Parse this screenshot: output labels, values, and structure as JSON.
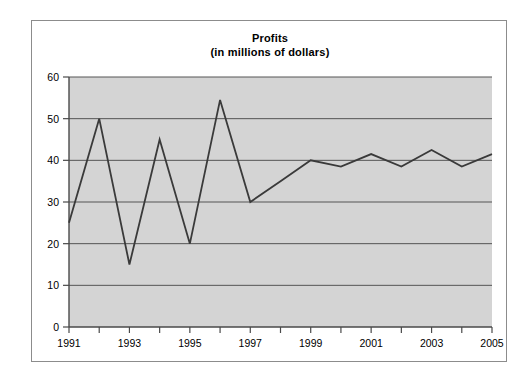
{
  "chart_data": {
    "type": "line",
    "title": "Profits",
    "subtitle": "(in millions of dollars)",
    "xlabel": "",
    "ylabel": "",
    "x": [
      1991,
      1992,
      1993,
      1994,
      1995,
      1996,
      1997,
      1998,
      1999,
      2000,
      2001,
      2002,
      2003,
      2004,
      2005
    ],
    "values": [
      25,
      50,
      15,
      45,
      20,
      54.5,
      30,
      35,
      40,
      38.5,
      41.5,
      38.5,
      42.5,
      38.5,
      41.5
    ],
    "series": [
      {
        "name": "Profits",
        "values": [
          25,
          50,
          15,
          45,
          20,
          54.5,
          30,
          35,
          40,
          38.5,
          41.5,
          38.5,
          42.5,
          38.5,
          41.5
        ]
      }
    ],
    "xlim": [
      1991,
      2005
    ],
    "ylim": [
      0,
      60
    ],
    "y_ticks": [
      0,
      10,
      20,
      30,
      40,
      50,
      60
    ],
    "y_tick_labels": [
      "0",
      "10",
      "20",
      "30",
      "40",
      "50",
      "60"
    ],
    "x_ticks": [
      1991,
      1992,
      1993,
      1994,
      1995,
      1996,
      1997,
      1998,
      1999,
      2000,
      2001,
      2002,
      2003,
      2004,
      2005
    ],
    "x_tick_labels": [
      "1991",
      "",
      "1993",
      "",
      "1995",
      "",
      "1997",
      "",
      "1999",
      "",
      "2001",
      "",
      "2003",
      "",
      "2005"
    ],
    "x_major_labels": [
      "1991",
      "1993",
      "1995",
      "1997",
      "1999",
      "2001",
      "2003",
      "2005"
    ],
    "grid": "horizontal",
    "legend": "none",
    "plot_background": "#d4d4d4",
    "line_color": "#3a3a3a",
    "gridline_color": "#555555",
    "axis_color": "#4a4a4a",
    "frame_color": "#8c8c8c",
    "page_background": "#ffffff"
  }
}
